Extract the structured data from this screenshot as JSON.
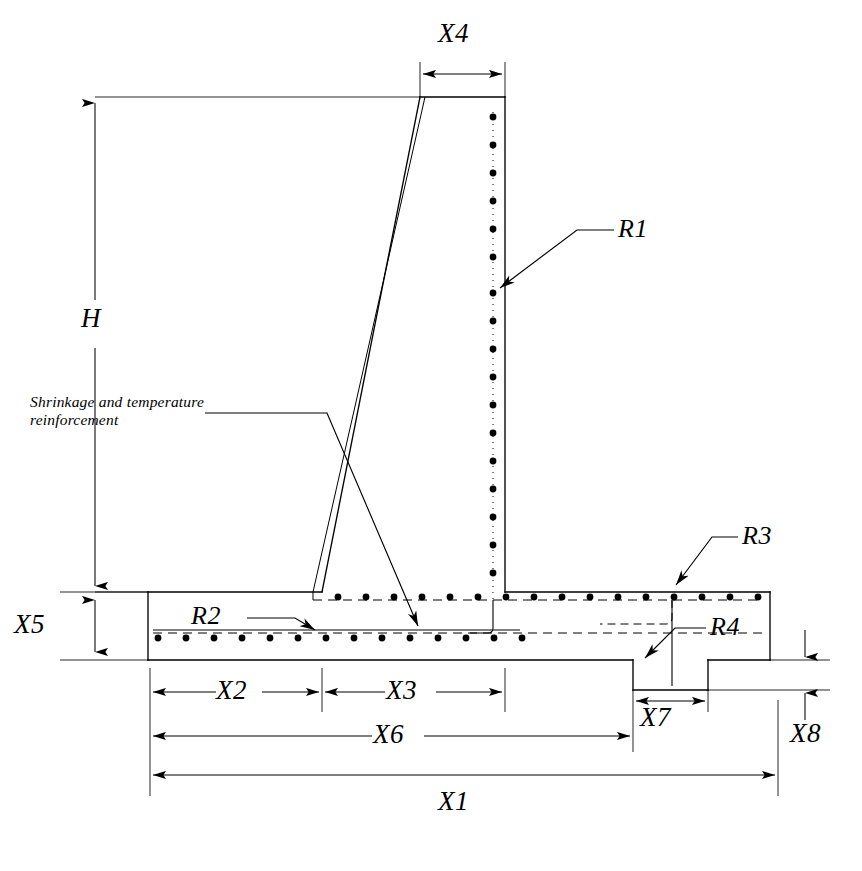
{
  "figure": {
    "type": "engineering-cross-section",
    "background_color": "#ffffff",
    "line_color": "#000000"
  },
  "dimensions": [
    {
      "id": "H",
      "label": "H",
      "orientation": "vertical",
      "description": "Overall wall height from top of stem to top of footing"
    },
    {
      "id": "X4",
      "label": "X4",
      "orientation": "horizontal",
      "description": "Stem thickness at top of wall"
    },
    {
      "id": "X5",
      "label": "X5",
      "orientation": "vertical",
      "description": "Footing thickness"
    },
    {
      "id": "X2",
      "label": "X2",
      "orientation": "horizontal",
      "description": "Heel projection width"
    },
    {
      "id": "X3",
      "label": "X3",
      "orientation": "horizontal",
      "description": "Stem base thickness"
    },
    {
      "id": "X6",
      "label": "X6",
      "orientation": "horizontal",
      "description": "Distance from footing left edge to shear key near face"
    },
    {
      "id": "X7",
      "label": "X7",
      "orientation": "horizontal",
      "description": "Shear key width"
    },
    {
      "id": "X8",
      "label": "X8",
      "orientation": "vertical",
      "description": "Shear key depth"
    },
    {
      "id": "X1",
      "label": "X1",
      "orientation": "horizontal",
      "description": "Overall footing width"
    }
  ],
  "reinforcement": [
    {
      "id": "R1",
      "label": "R1",
      "description": "Vertical stem reinforcement on the soil face"
    },
    {
      "id": "R2",
      "label": "R2",
      "description": "Bottom footing reinforcement (heel)"
    },
    {
      "id": "R3",
      "label": "R3",
      "description": "Top footing reinforcement (toe)"
    },
    {
      "id": "R4",
      "label": "R4",
      "description": "Shear key reinforcement"
    }
  ],
  "notes": [
    {
      "id": "shrinkage-note",
      "line1": "Shrinkage and temperature",
      "line2": "reinforcement"
    }
  ],
  "geometry": {
    "wall_top_y": 97,
    "stem_top_left_x": 420,
    "stem_right_x": 505,
    "stem_base_left_x": 322,
    "footing_top_y": 592,
    "footing_bottom_y": 660,
    "footing_left_x": 148,
    "footing_right_x": 770,
    "key_left_x": 633,
    "key_right_x": 708,
    "key_bottom_y": 690
  }
}
